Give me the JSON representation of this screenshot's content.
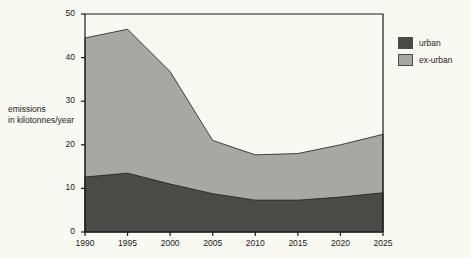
{
  "chart_data": {
    "type": "area",
    "title": "",
    "subtitle": "",
    "xlabel": "",
    "ylabel": "emissions\nin kilotonnes/year",
    "ylabel_lines": [
      "emissions",
      "in kilotonnes/year"
    ],
    "stacked": true,
    "x": [
      1990,
      1995,
      2000,
      2005,
      2010,
      2015,
      2020,
      2025
    ],
    "categories": [
      "1990",
      "1995",
      "2000",
      "2005",
      "2010",
      "2015",
      "2020",
      "2025"
    ],
    "series": [
      {
        "name": "urban",
        "color": "#4a4a46",
        "values": [
          12.6,
          13.5,
          11.0,
          8.8,
          7.3,
          7.3,
          8.0,
          9.0
        ]
      },
      {
        "name": "ex-urban",
        "color": "#a8a8a2",
        "values": [
          31.9,
          33.0,
          25.8,
          12.2,
          10.4,
          10.7,
          12.0,
          13.4
        ]
      }
    ],
    "totals": [
      44.5,
      46.5,
      36.8,
      21.0,
      17.7,
      18.0,
      20.0,
      22.4
    ],
    "xlim": [
      1990,
      2025
    ],
    "ylim": [
      0,
      50
    ],
    "yticks": [
      0,
      10,
      20,
      30,
      40,
      50
    ],
    "ytick_labels": [
      "0",
      "10",
      "20",
      "30",
      "40",
      "50"
    ],
    "xticks": [
      1990,
      1995,
      2000,
      2005,
      2010,
      2015,
      2020,
      2025
    ],
    "xtick_labels": [
      "1990",
      "1995",
      "2000",
      "2005",
      "2010",
      "2015",
      "2020",
      "2025"
    ],
    "grid": false,
    "legend_position": "right-top",
    "legend": [
      {
        "label": "urban",
        "color": "#4a4a46"
      },
      {
        "label": "ex-urban",
        "color": "#a8a8a2"
      }
    ],
    "background_color": "#faf9f1",
    "frame_color": "#1a1a1a"
  },
  "figure": {
    "y_axis_caption_line1": "emissions",
    "y_axis_caption_line2": "in kilotonnes/year"
  }
}
